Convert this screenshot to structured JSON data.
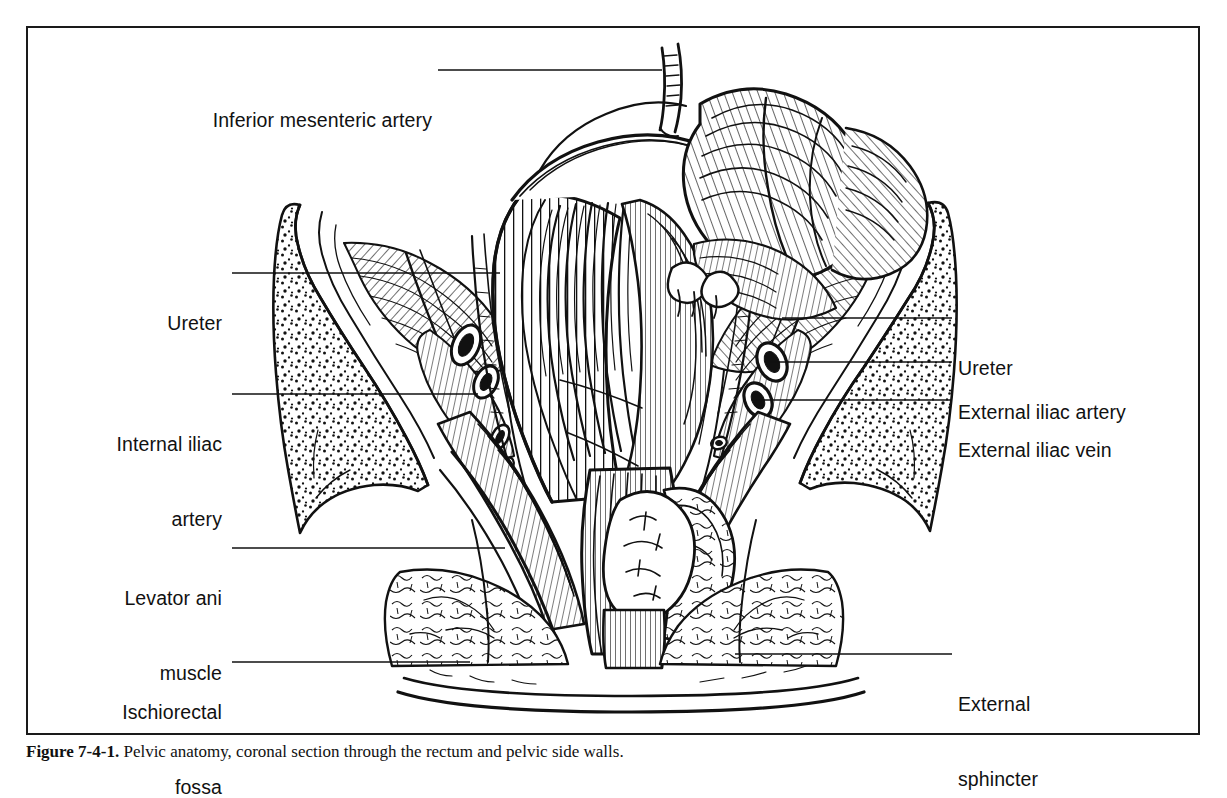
{
  "figure": {
    "caption_prefix": "Figure 7-4-1.",
    "caption_text": "Pelvic anatomy, coronal section through the rectum and pelvic side walls.",
    "border_color": "#1a1a1a",
    "ink_color": "#111111",
    "background_color": "#ffffff"
  },
  "labels": {
    "left": [
      {
        "id": "inferior-mesenteric-artery",
        "lines": [
          "Inferior mesenteric artery"
        ],
        "text_right_x": 432,
        "baseline_y": 70,
        "leader": {
          "x1": 438,
          "y1": 70,
          "x2": 662,
          "y2": 70
        }
      },
      {
        "id": "ureter-left",
        "lines": [
          "Ureter"
        ],
        "text_right_x": 222,
        "baseline_y": 273,
        "leader": {
          "x1": 232,
          "y1": 273,
          "x2": 500,
          "y2": 273
        }
      },
      {
        "id": "internal-iliac-artery",
        "lines": [
          "Internal iliac",
          "artery"
        ],
        "text_right_x": 222,
        "baseline_y": 394,
        "leader": {
          "x1": 232,
          "y1": 394,
          "x2": 478,
          "y2": 394
        }
      },
      {
        "id": "levator-ani-muscle",
        "lines": [
          "Levator ani",
          "muscle"
        ],
        "text_right_x": 222,
        "baseline_y": 548,
        "leader": {
          "x1": 232,
          "y1": 548,
          "x2": 505,
          "y2": 548
        }
      },
      {
        "id": "ischiorectal-fossa",
        "lines": [
          "Ischiorectal",
          "fossa"
        ],
        "text_right_x": 222,
        "baseline_y": 662,
        "leader": {
          "x1": 232,
          "y1": 662,
          "x2": 470,
          "y2": 662
        }
      }
    ],
    "right": [
      {
        "id": "ureter-right",
        "lines": [
          "Ureter"
        ],
        "text_left_x": 958,
        "baseline_y": 318,
        "leader": {
          "x1": 782,
          "y1": 318,
          "x2": 952,
          "y2": 318
        }
      },
      {
        "id": "external-iliac-artery",
        "lines": [
          "External iliac artery"
        ],
        "text_left_x": 958,
        "baseline_y": 362,
        "leader": {
          "x1": 770,
          "y1": 362,
          "x2": 952,
          "y2": 362
        }
      },
      {
        "id": "external-iliac-vein",
        "lines": [
          "External iliac vein"
        ],
        "text_left_x": 958,
        "baseline_y": 400,
        "leader": {
          "x1": 770,
          "y1": 400,
          "x2": 952,
          "y2": 400
        }
      },
      {
        "id": "external-sphincter",
        "lines": [
          "External",
          "sphincter"
        ],
        "text_left_x": 958,
        "baseline_y": 654,
        "leader": {
          "x1": 735,
          "y1": 654,
          "x2": 952,
          "y2": 654
        }
      }
    ]
  },
  "anatomy_parts": [
    "rectum",
    "sigmoid-colon",
    "mesentery",
    "left-hip-bone",
    "right-hip-bone",
    "levator-ani-muscle",
    "external-anal-sphincter",
    "ischiorectal-fossa-fat",
    "internal-iliac-artery",
    "external-iliac-artery",
    "external-iliac-vein",
    "ureter-left",
    "ureter-right",
    "inferior-mesenteric-artery",
    "perineal-skin"
  ]
}
